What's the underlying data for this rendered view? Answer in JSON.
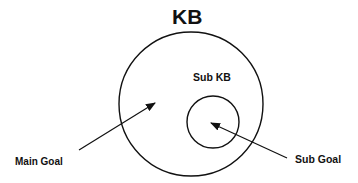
{
  "diagram": {
    "title": "KB",
    "inner_label": "Sub KB",
    "labels": {
      "main_goal": "Main Goal",
      "sub_goal": "Sub Goal"
    },
    "shapes": {
      "outer_circle": {
        "cx": 191,
        "cy": 104,
        "r": 72
      },
      "inner_circle": {
        "cx": 213,
        "cy": 122,
        "r": 26
      }
    },
    "arrows": [
      {
        "from": "Main Goal",
        "to": "KB interior"
      },
      {
        "from": "Sub Goal",
        "to": "Sub KB interior"
      }
    ],
    "stroke_color": "#111111"
  }
}
